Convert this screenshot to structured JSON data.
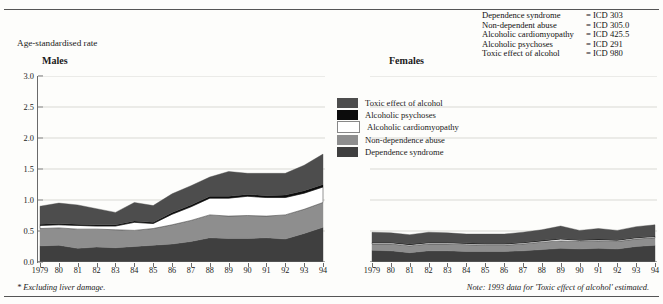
{
  "axis_title": "Age-standardised rate",
  "panels": {
    "males_label": "Males",
    "females_label": "Females"
  },
  "icd_key": {
    "rows": [
      {
        "name": "Dependence syndrome",
        "code": "= ICD 303"
      },
      {
        "name": "Non-dependent abuse",
        "code": "= ICD 305.0"
      },
      {
        "name": "Alcoholic cardiomyopathy",
        "code": "= ICD 425.5"
      },
      {
        "name": "Alcoholic psychoses",
        "code": "= ICD 291"
      },
      {
        "name": "Toxic effect of alcohol",
        "code": "= ICD 980"
      }
    ]
  },
  "legend": {
    "entries": [
      {
        "label": "Toxic effect of alcohol",
        "color": "#4d4d4d"
      },
      {
        "label": "Alcoholic psychoses",
        "color": "#0c0c0c"
      },
      {
        "label": "Alcoholic cardiomyopathy",
        "color": "#ffffff"
      },
      {
        "label": "Non-dependence abuse",
        "color": "#8e8e8e"
      },
      {
        "label": "Dependence syndrome",
        "color": "#3f3f3f"
      }
    ]
  },
  "footnotes": {
    "left": "* Excluding liver damage.",
    "right": "Note: 1993 data for 'Toxic effect of alcohol' estimated."
  },
  "chart_data": {
    "type": "area",
    "title": "Age-standardised rate",
    "xlabel": "",
    "ylabel": "Age-standardised rate",
    "ylim": [
      0.0,
      3.0
    ],
    "ytick_labels": [
      "0.0",
      "0.5",
      "1.0",
      "1.5",
      "2.0",
      "2.5",
      "3.0"
    ],
    "ytick_values": [
      0.0,
      0.5,
      1.0,
      1.5,
      2.0,
      2.5,
      3.0
    ],
    "grid": true,
    "legend_position": "center",
    "x": [
      1979,
      1980,
      1981,
      1982,
      1983,
      1984,
      1985,
      1986,
      1987,
      1988,
      1989,
      1990,
      1991,
      1992,
      1993,
      1994
    ],
    "xtick_labels": [
      "1979",
      "80",
      "81",
      "82",
      "83",
      "84",
      "85",
      "86",
      "87",
      "88",
      "89",
      "90",
      "91",
      "92",
      "93",
      "94"
    ],
    "panels": [
      {
        "name": "Males",
        "stack_order": [
          "Dependence syndrome",
          "Non-dependence abuse",
          "Alcoholic cardiomyopathy",
          "Alcoholic psychoses",
          "Toxic effect of alcohol"
        ],
        "series": [
          {
            "name": "Dependence syndrome",
            "color": "#3f3f3f",
            "values": [
              0.26,
              0.27,
              0.22,
              0.24,
              0.23,
              0.25,
              0.27,
              0.29,
              0.33,
              0.39,
              0.38,
              0.38,
              0.39,
              0.37,
              0.46,
              0.56
            ]
          },
          {
            "name": "Non-dependence abuse",
            "color": "#8e8e8e",
            "values": [
              0.28,
              0.28,
              0.31,
              0.29,
              0.29,
              0.26,
              0.27,
              0.31,
              0.34,
              0.37,
              0.36,
              0.37,
              0.35,
              0.39,
              0.39,
              0.4
            ]
          },
          {
            "name": "Alcoholic cardiomyopathy",
            "color": "#ffffff",
            "values": [
              0.05,
              0.05,
              0.06,
              0.05,
              0.06,
              0.13,
              0.08,
              0.17,
              0.22,
              0.27,
              0.29,
              0.31,
              0.3,
              0.28,
              0.26,
              0.25
            ]
          },
          {
            "name": "Alcoholic psychoses",
            "color": "#0c0c0c",
            "values": [
              0.02,
              0.02,
              0.02,
              0.02,
              0.02,
              0.02,
              0.02,
              0.03,
              0.03,
              0.03,
              0.03,
              0.03,
              0.03,
              0.04,
              0.04,
              0.04
            ]
          },
          {
            "name": "Toxic effect of alcohol",
            "color": "#4d4d4d",
            "values": [
              0.29,
              0.33,
              0.31,
              0.26,
              0.2,
              0.3,
              0.27,
              0.3,
              0.31,
              0.31,
              0.4,
              0.34,
              0.36,
              0.35,
              0.41,
              0.49
            ]
          }
        ],
        "totals": [
          0.9,
          0.95,
          0.92,
          0.86,
          0.8,
          0.96,
          0.91,
          1.1,
          1.23,
          1.37,
          1.46,
          1.43,
          1.43,
          1.43,
          1.56,
          1.74
        ]
      },
      {
        "name": "Females",
        "stack_order": [
          "Dependence syndrome",
          "Non-dependence abuse",
          "Alcoholic cardiomyopathy",
          "Alcoholic psychoses",
          "Toxic effect of alcohol"
        ],
        "series": [
          {
            "name": "Dependence syndrome",
            "color": "#3f3f3f",
            "values": [
              0.19,
              0.18,
              0.15,
              0.18,
              0.18,
              0.17,
              0.17,
              0.17,
              0.18,
              0.2,
              0.22,
              0.21,
              0.22,
              0.21,
              0.25,
              0.27
            ]
          },
          {
            "name": "Non-dependence abuse",
            "color": "#8e8e8e",
            "values": [
              0.1,
              0.11,
              0.11,
              0.11,
              0.11,
              0.11,
              0.1,
              0.1,
              0.11,
              0.12,
              0.12,
              0.12,
              0.12,
              0.12,
              0.12,
              0.12
            ]
          },
          {
            "name": "Alcoholic cardiomyopathy",
            "color": "#ffffff",
            "values": [
              0.02,
              0.02,
              0.02,
              0.02,
              0.02,
              0.02,
              0.02,
              0.02,
              0.02,
              0.02,
              0.03,
              0.02,
              0.02,
              0.02,
              0.02,
              0.02
            ]
          },
          {
            "name": "Alcoholic psychoses",
            "color": "#0c0c0c",
            "values": [
              0.01,
              0.01,
              0.01,
              0.01,
              0.01,
              0.01,
              0.01,
              0.01,
              0.01,
              0.01,
              0.01,
              0.01,
              0.01,
              0.01,
              0.01,
              0.01
            ]
          },
          {
            "name": "Toxic effect of alcohol",
            "color": "#4d4d4d",
            "values": [
              0.16,
              0.15,
              0.15,
              0.16,
              0.15,
              0.14,
              0.15,
              0.15,
              0.16,
              0.17,
              0.2,
              0.15,
              0.17,
              0.15,
              0.17,
              0.18
            ]
          }
        ],
        "totals": [
          0.48,
          0.47,
          0.44,
          0.48,
          0.47,
          0.45,
          0.45,
          0.45,
          0.48,
          0.52,
          0.58,
          0.51,
          0.54,
          0.51,
          0.57,
          0.6
        ]
      }
    ]
  }
}
